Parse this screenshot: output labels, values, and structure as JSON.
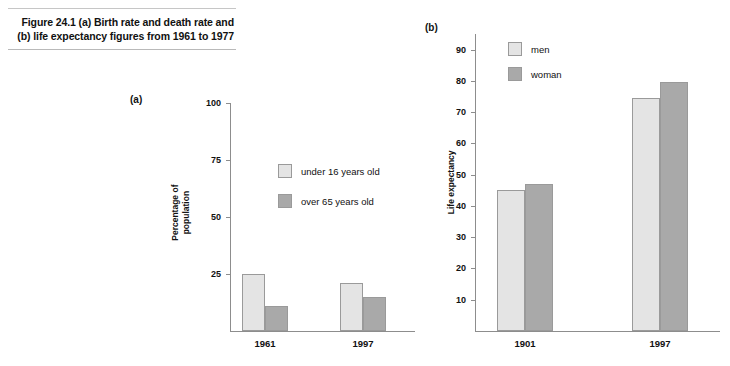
{
  "caption": {
    "text": "Figure 24.1  (a) Birth rate and death rate and (b) life expectancy figures from 1961 to 1977"
  },
  "colors": {
    "series_light": "#e4e4e4",
    "series_dark": "#a9a9a9",
    "bar_border": "#9a9a9a",
    "axis": "#8d8d8d",
    "rule": "#b9b9b9",
    "text": "#111111"
  },
  "chart_data": [
    {
      "type": "bar",
      "panel": "(a)",
      "title": "",
      "xlabel": "",
      "ylabel": "Percentage of\npopulation",
      "categories": [
        "1961",
        "1997"
      ],
      "ylim": [
        0,
        100
      ],
      "yticks": [
        25,
        50,
        75,
        100
      ],
      "ytick_labels": [
        "25",
        "50",
        "75",
        "100"
      ],
      "grid": false,
      "legend_position": "upper-center",
      "series": [
        {
          "name": "under 16 years old",
          "color": "#e4e4e4",
          "values": [
            25,
            21
          ]
        },
        {
          "name": "over 65 years old",
          "color": "#a9a9a9",
          "values": [
            11,
            15
          ]
        }
      ]
    },
    {
      "type": "bar",
      "panel": "(b)",
      "title": "",
      "xlabel": "",
      "ylabel": "Life expectancy",
      "categories": [
        "1901",
        "1997"
      ],
      "ylim": [
        0,
        95
      ],
      "yticks": [
        10,
        20,
        30,
        40,
        50,
        60,
        70,
        80,
        90
      ],
      "ytick_labels": [
        "10",
        "20",
        "30",
        "40",
        "50",
        "60",
        "70",
        "80",
        "90"
      ],
      "grid": false,
      "legend_position": "upper-center",
      "series": [
        {
          "name": "men",
          "color": "#e4e4e4",
          "values": [
            45,
            74.5
          ]
        },
        {
          "name": "woman",
          "color": "#a9a9a9",
          "values": [
            47,
            79.5
          ]
        }
      ]
    }
  ]
}
